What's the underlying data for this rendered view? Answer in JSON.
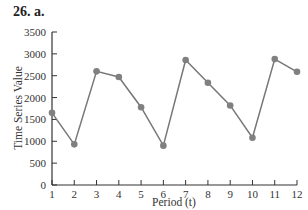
{
  "heading": "26.  a.",
  "chart_data": {
    "type": "line",
    "title": "",
    "xlabel": "Period (t)",
    "ylabel": "Time Series Value",
    "x": [
      1,
      2,
      3,
      4,
      5,
      6,
      7,
      8,
      9,
      10,
      11,
      12
    ],
    "series": [
      {
        "name": "Time Series Value",
        "values": [
          1650,
          930,
          2600,
          2470,
          1780,
          900,
          2860,
          2340,
          1820,
          1080,
          2880,
          2590
        ]
      }
    ],
    "yticks": [
      0,
      500,
      1000,
      1500,
      2000,
      2500,
      3000,
      3500
    ],
    "xticks": [
      1,
      2,
      3,
      4,
      5,
      6,
      7,
      8,
      9,
      10,
      11,
      12
    ],
    "ylim": [
      0,
      3500
    ],
    "xlim": [
      1,
      12
    ],
    "grid": false,
    "legend": "none",
    "marker": "circle",
    "line_color": "#777777",
    "marker_color": "#808080"
  }
}
